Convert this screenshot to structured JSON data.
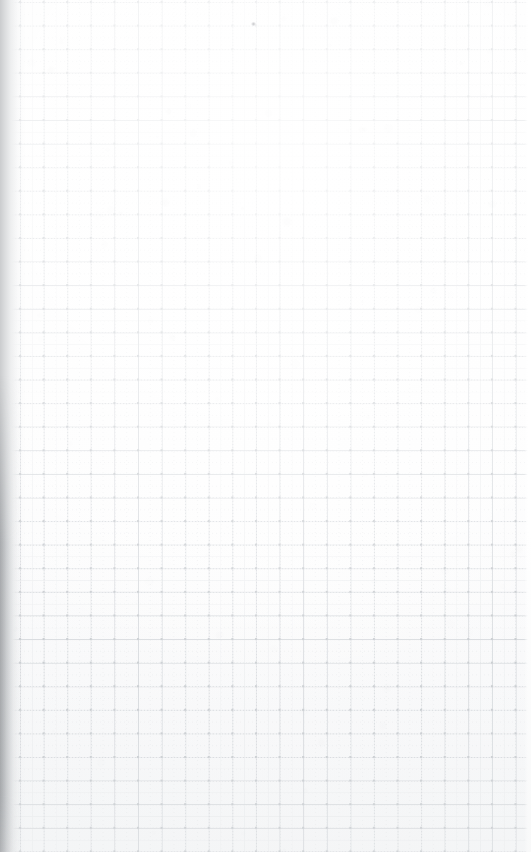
{
  "document": {
    "kind": "blank-grid-paper-scan",
    "title": "Blank Grid Paper Scan",
    "page_width_px": 531,
    "page_height_px": 852,
    "orientation": "portrait",
    "has_text_content": false,
    "has_handwriting": false,
    "content_note": "",
    "paper": {
      "base_color": "#ffffff",
      "tint_color": "#f8f9fa",
      "description": "blank sheet of squared / quadrille graph paper, no writing"
    }
  },
  "grid": {
    "style": "dotted",
    "major_cell_px": 23.6,
    "subdivision_per_cell": 2,
    "origin_x_px": 20,
    "origin_y_px": 2,
    "line_color_major": "#d5d8dc",
    "line_color_fine": "#e6e8ea",
    "node_color": "#c4c8cc",
    "dash_on_px": 1,
    "dash_off_px": 2,
    "ruled_left_px": 20,
    "ruled_right_px": 524,
    "approx_columns": 21,
    "approx_rows": 36
  },
  "lighting": {
    "left_edge_shadow_color": "#96999d",
    "left_edge_shadow_width_px": 26,
    "left_shadow_strongest_region": "lower-half",
    "brightest_region": "upper-middle",
    "vignette_bottom_color": "#eceeef"
  },
  "artifacts": {
    "speck": {
      "label": "stray-speck",
      "x_px": 251,
      "y_px": 22,
      "color": "#96989c"
    }
  }
}
